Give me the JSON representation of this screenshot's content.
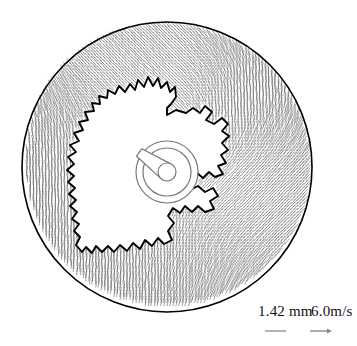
{
  "figure": {
    "kind": "vector-field-polar-plot",
    "background_color": "#ffffff",
    "line_color": "#000000",
    "vector_color": "#555555"
  },
  "outer_disc": {
    "name": "outer-boundary-circle",
    "cx": 167,
    "cy": 167,
    "r": 145,
    "stroke_width": 1.6
  },
  "hub": {
    "name": "central-hub",
    "cx": 167,
    "cy": 172,
    "outer_r": 31,
    "inner_r": 24,
    "core_r": 9,
    "pointer_angle_deg": 215,
    "pointer_length": 34,
    "stroke_color": "#777777"
  },
  "legend": {
    "length_label": "1.42 mm",
    "velocity_label": "6.0m/s",
    "length_marker": "scale-dash",
    "velocity_marker": "scale-arrow",
    "length_marker_x1": 265,
    "length_marker_x2": 286,
    "length_marker_y": 331,
    "velocity_marker_x1": 310,
    "velocity_marker_x2": 332,
    "velocity_marker_y": 331
  },
  "chart_data": {
    "type": "scatter",
    "title": "",
    "subtitle": "",
    "xlabel": "",
    "ylabel": "",
    "grid": false,
    "legend_position": "bottom-right",
    "annotations": [
      "1.42 mm",
      "6.0m/s"
    ],
    "scale_reference": {
      "length_per_marker": 1.42,
      "length_units": "mm",
      "velocity_per_marker": 6.0,
      "velocity_units": "m/s"
    },
    "contour": {
      "name": "interface-contour",
      "closed": true,
      "units": "pixels",
      "points": [
        [
          167,
          115
        ],
        [
          176,
          110
        ],
        [
          186,
          113
        ],
        [
          193,
          108
        ],
        [
          200,
          113
        ],
        [
          205,
          106
        ],
        [
          212,
          112
        ],
        [
          206,
          120
        ],
        [
          214,
          124
        ],
        [
          222,
          118
        ],
        [
          228,
          124
        ],
        [
          222,
          131
        ],
        [
          229,
          136
        ],
        [
          222,
          143
        ],
        [
          228,
          150
        ],
        [
          221,
          155
        ],
        [
          226,
          163
        ],
        [
          218,
          166
        ],
        [
          223,
          174
        ],
        [
          215,
          177
        ],
        [
          209,
          172
        ],
        [
          203,
          178
        ],
        [
          197,
          173
        ],
        [
          192,
          180
        ],
        [
          186,
          176
        ],
        [
          183,
          185
        ],
        [
          190,
          190
        ],
        [
          198,
          186
        ],
        [
          205,
          192
        ],
        [
          213,
          188
        ],
        [
          218,
          196
        ],
        [
          210,
          201
        ],
        [
          214,
          209
        ],
        [
          205,
          212
        ],
        [
          198,
          206
        ],
        [
          192,
          212
        ],
        [
          185,
          206
        ],
        [
          180,
          213
        ],
        [
          173,
          208
        ],
        [
          168,
          216
        ],
        [
          174,
          223
        ],
        [
          168,
          231
        ],
        [
          172,
          240
        ],
        [
          164,
          244
        ],
        [
          158,
          238
        ],
        [
          152,
          246
        ],
        [
          145,
          240
        ],
        [
          140,
          249
        ],
        [
          133,
          243
        ],
        [
          127,
          251
        ],
        [
          120,
          245
        ],
        [
          114,
          252
        ],
        [
          108,
          246
        ],
        [
          102,
          252
        ],
        [
          96,
          246
        ],
        [
          92,
          253
        ],
        [
          86,
          247
        ],
        [
          82,
          252
        ],
        [
          76,
          245
        ],
        [
          80,
          237
        ],
        [
          74,
          231
        ],
        [
          79,
          224
        ],
        [
          72,
          219
        ],
        [
          77,
          212
        ],
        [
          70,
          206
        ],
        [
          76,
          200
        ],
        [
          69,
          194
        ],
        [
          75,
          188
        ],
        [
          68,
          182
        ],
        [
          74,
          176
        ],
        [
          67,
          170
        ],
        [
          74,
          164
        ],
        [
          68,
          157
        ],
        [
          76,
          152
        ],
        [
          70,
          145
        ],
        [
          79,
          141
        ],
        [
          74,
          133
        ],
        [
          83,
          130
        ],
        [
          79,
          122
        ],
        [
          88,
          120
        ],
        [
          85,
          112
        ],
        [
          94,
          111
        ],
        [
          92,
          103
        ],
        [
          100,
          104
        ],
        [
          99,
          96
        ],
        [
          107,
          98
        ],
        [
          108,
          90
        ],
        [
          115,
          94
        ],
        [
          119,
          86
        ],
        [
          125,
          92
        ],
        [
          130,
          84
        ],
        [
          135,
          90
        ],
        [
          138,
          80
        ],
        [
          144,
          87
        ],
        [
          148,
          77
        ],
        [
          153,
          86
        ],
        [
          158,
          78
        ],
        [
          161,
          88
        ],
        [
          167,
          82
        ],
        [
          170,
          92
        ],
        [
          175,
          87
        ],
        [
          176,
          97
        ],
        [
          171,
          104
        ],
        [
          167,
          108
        ]
      ]
    },
    "vector_field": {
      "count_approx": 3600,
      "ring_inner_r": 34,
      "ring_outer_r": 143,
      "stroke_len_px": 7,
      "pattern": "radial-swirl",
      "note": "Vectors drawn only outside the interface contour; orientation rotates from near-vertical in the upper/right sectors to oblique in the lower-left sector."
    }
  }
}
